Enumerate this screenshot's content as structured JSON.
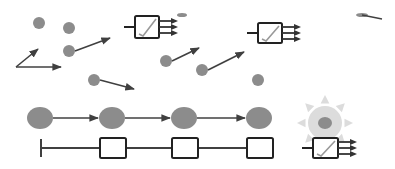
{
  "diagram": {
    "width": 395,
    "height": 169,
    "background": "#ffffff",
    "colors": {
      "particle": "#8c8c8c",
      "line": "#404040",
      "glow": "#dcdcdc",
      "glow_core": "#8c8c8c"
    },
    "free_particles": [
      {
        "cx": 39,
        "cy": 23,
        "r": 6
      },
      {
        "cx": 69,
        "cy": 28,
        "r": 6
      },
      {
        "cx": 69,
        "cy": 51,
        "r": 6
      },
      {
        "cx": 94,
        "cy": 80,
        "r": 6
      },
      {
        "cx": 166,
        "cy": 61,
        "r": 6
      },
      {
        "cx": 202,
        "cy": 70,
        "r": 6
      },
      {
        "cx": 258,
        "cy": 80,
        "r": 6
      }
    ],
    "arrows": [
      {
        "x1": 16,
        "y1": 67,
        "x2": 38,
        "y2": 49
      },
      {
        "x1": 16,
        "y1": 67,
        "x2": 61,
        "y2": 67
      },
      {
        "x1": 75,
        "y1": 51,
        "x2": 110,
        "y2": 38
      },
      {
        "x1": 100,
        "y1": 80,
        "x2": 134,
        "y2": 89
      },
      {
        "x1": 172,
        "y1": 61,
        "x2": 199,
        "y2": 48
      },
      {
        "x1": 208,
        "y1": 70,
        "x2": 244,
        "y2": 52
      }
    ],
    "partial_particles": [
      {
        "cx": 182,
        "cy": 15,
        "rx": 5,
        "ry": 2
      },
      {
        "cx": 362,
        "cy": 15,
        "rx": 6,
        "ry": 2,
        "tail": {
          "x2": 382,
          "y2": 19
        }
      }
    ],
    "detectors": [
      {
        "x": 135,
        "y": 16,
        "w": 24,
        "h": 22
      },
      {
        "x": 258,
        "y": 23,
        "w": 24,
        "h": 20
      },
      {
        "x": 313,
        "y": 138,
        "w": 25,
        "h": 20
      }
    ],
    "chain": {
      "y": 118,
      "particles": [
        {
          "cx": 40,
          "rx": 13,
          "ry": 11
        },
        {
          "cx": 112,
          "rx": 13,
          "ry": 11
        },
        {
          "cx": 184,
          "rx": 13,
          "ry": 11
        },
        {
          "cx": 259,
          "rx": 13,
          "ry": 11
        }
      ]
    },
    "track": {
      "y": 148,
      "start_x": 41,
      "boxes": [
        {
          "x": 100,
          "w": 26,
          "h": 20
        },
        {
          "x": 172,
          "w": 26,
          "h": 20
        },
        {
          "x": 247,
          "w": 26,
          "h": 20
        }
      ]
    },
    "glow_particle": {
      "cx": 325,
      "cy": 123,
      "r": 17,
      "core_rx": 7,
      "core_ry": 6
    }
  }
}
